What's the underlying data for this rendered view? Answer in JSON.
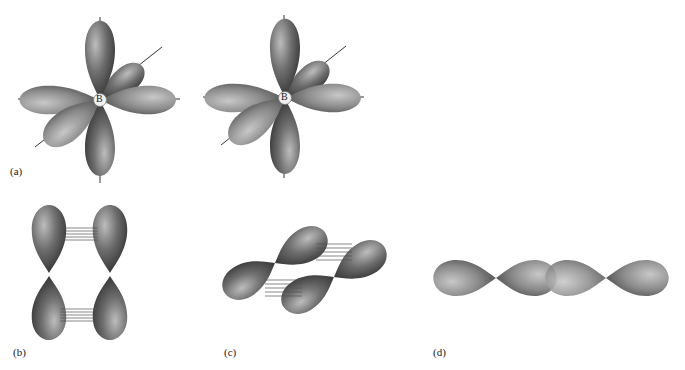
{
  "figure": {
    "panels": [
      {
        "id": "a",
        "label": "(a)",
        "description": "Boron atom with three p orbitals along x, y, z axes",
        "atom_label": "B"
      },
      {
        "id": "a2",
        "label": "",
        "description": "Boron atom with p orbitals (second view)",
        "atom_label": "B"
      },
      {
        "id": "b",
        "label": "(b)",
        "description": "Two parallel p orbitals showing side-by-side overlap"
      },
      {
        "id": "c",
        "label": "(c)",
        "description": "Two tilted p orbitals with side-by-side overlap"
      },
      {
        "id": "d",
        "label": "(d)",
        "description": "Two p orbitals with end-on overlap"
      }
    ],
    "colors": {
      "lobe_dark": "#2e2e2e",
      "lobe_mid": "#6a6a6a",
      "lobe_light": "#b8b8b8",
      "axis": "#333333",
      "overlap_lines": "#555555",
      "background": "#ffffff"
    }
  }
}
